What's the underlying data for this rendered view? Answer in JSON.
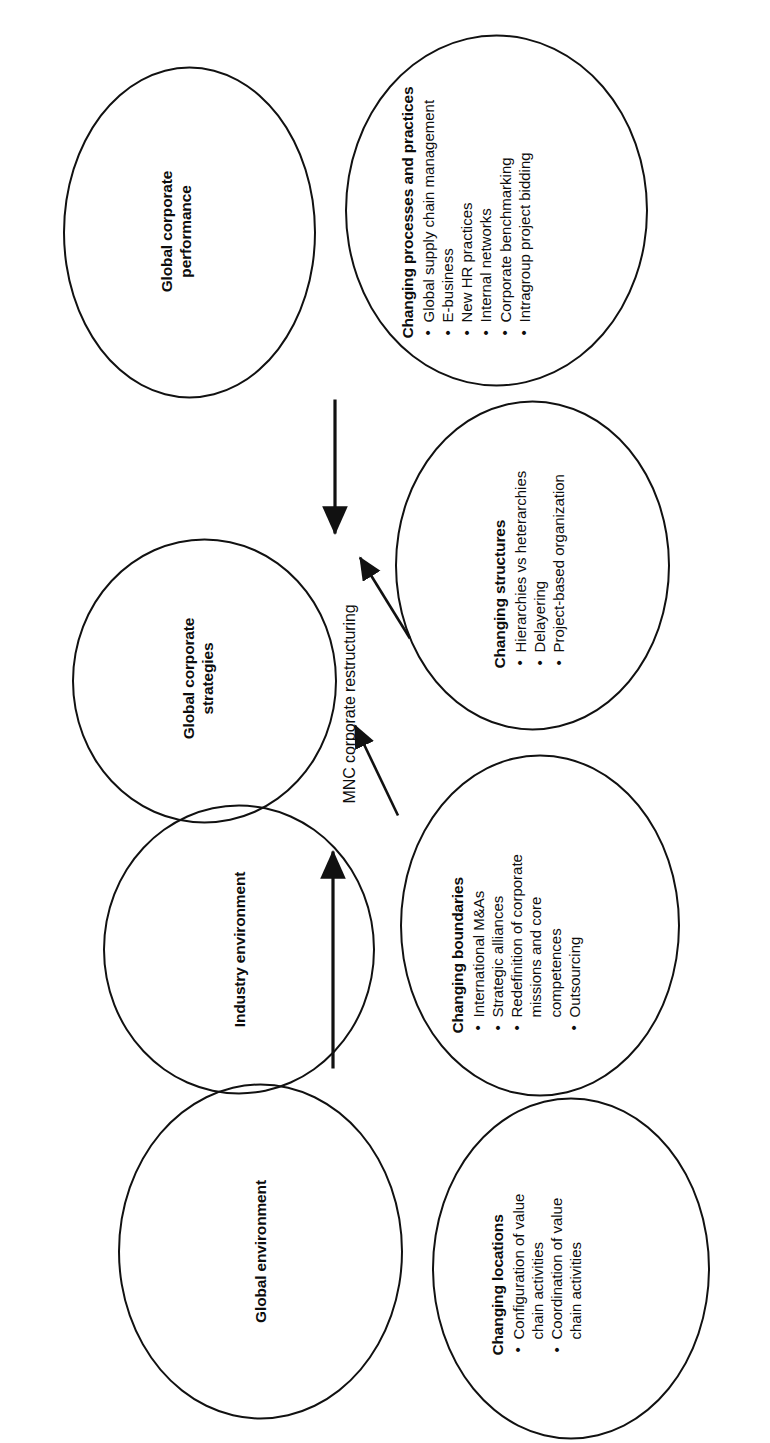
{
  "diagram": {
    "center_label": "MNC corporate restructuring",
    "nodes": [
      {
        "id": "global-environment",
        "name": "global-environment-ellipse",
        "label": "Global environment"
      },
      {
        "id": "industry-environment",
        "name": "industry-environment-ellipse",
        "label": "Industry environment"
      },
      {
        "id": "global-corporate-strategies",
        "name": "global-corporate-strategies-ellipse",
        "label_line1": "Global corporate",
        "label_line2": "strategies"
      },
      {
        "id": "global-corporate-performance",
        "name": "global-corporate-performance-ellipse",
        "label_line1": "Global corporate",
        "label_line2": "performance"
      }
    ],
    "detail_nodes": [
      {
        "id": "changing-locations",
        "title": "Changing locations",
        "items": [
          {
            "lines": [
              "Configuration of value",
              "chain activities"
            ]
          },
          {
            "lines": [
              "Coordination of value",
              "chain activities"
            ]
          }
        ]
      },
      {
        "id": "changing-boundaries",
        "title": "Changing boundaries",
        "items": [
          {
            "lines": [
              "International M&As"
            ]
          },
          {
            "lines": [
              "Strategic alliances"
            ]
          },
          {
            "lines": [
              "Redefinition of corporate",
              "missions and core",
              "competences"
            ]
          },
          {
            "lines": [
              "Outsourcing"
            ]
          }
        ]
      },
      {
        "id": "changing-structures",
        "title": "Changing structures",
        "items": [
          {
            "lines": [
              "Hierarchies vs heterarchies"
            ]
          },
          {
            "lines": [
              "Delayering"
            ]
          },
          {
            "lines": [
              "Project-based organization"
            ]
          }
        ]
      },
      {
        "id": "changing-processes-and-practices",
        "title": "Changing processes and practices",
        "items": [
          {
            "lines": [
              "Global supply chain management"
            ]
          },
          {
            "lines": [
              "E-business"
            ]
          },
          {
            "lines": [
              "New HR practices"
            ]
          },
          {
            "lines": [
              "Internal networks"
            ]
          },
          {
            "lines": [
              "Corporate benchmarking"
            ]
          },
          {
            "lines": [
              "Intragroup project bidding"
            ]
          }
        ]
      }
    ],
    "bullet_glyph": "•",
    "colors": {
      "stroke": "#111111",
      "text": "#0d0d0d",
      "background": "#ffffff"
    }
  }
}
